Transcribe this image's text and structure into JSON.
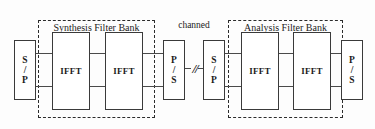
{
  "diagram": {
    "colors": {
      "background": "#fdfdfd",
      "block_border": "#3a3a3a",
      "bank_border": "#2b2b2b",
      "wire": "#4a4a4a",
      "text": "#1b1b1b"
    },
    "serial_parallel_input": {
      "line1": "S",
      "line2": "/",
      "line3": "P"
    },
    "synthesis_bank": {
      "title": "Synthesis Filter Bank",
      "blocks": [
        {
          "label": "IFFT"
        },
        {
          "label": "IFFT"
        }
      ]
    },
    "parallel_serial_tx": {
      "line1": "P",
      "line2": "/",
      "line3": "S"
    },
    "channel": {
      "label": "channed",
      "break_symbol": "//"
    },
    "serial_parallel_rx": {
      "line1": "S",
      "line2": "/",
      "line3": "P"
    },
    "analysis_bank": {
      "title": "Analysis Filter Bank",
      "blocks": [
        {
          "label": "IFFT"
        },
        {
          "label": "IFFT"
        }
      ]
    },
    "parallel_serial_output": {
      "line1": "P",
      "line2": "/",
      "line3": "S"
    }
  }
}
